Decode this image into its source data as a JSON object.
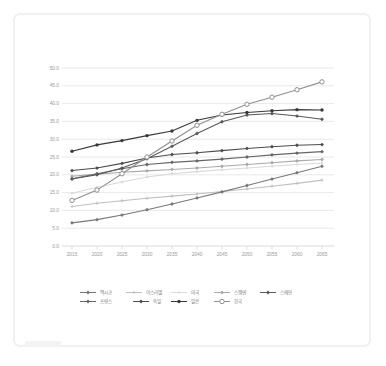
{
  "page": {
    "background": "#ffffff"
  },
  "card": {
    "border_color": "#f1f1f1"
  },
  "chart_data": {
    "type": "line",
    "title": "",
    "xlabel": "",
    "ylabel": "",
    "x_years": [
      2015,
      2020,
      2025,
      2030,
      2035,
      2040,
      2045,
      2050,
      2055,
      2060,
      2065
    ],
    "x_tick_labels": [
      "2015",
      "2020",
      "2025",
      "2030",
      "2035",
      "2040",
      "2045",
      "2050",
      "2055",
      "2060",
      "2065"
    ],
    "y_tick_labels": [
      "0.0",
      "5.0",
      "10.0",
      "15.0",
      "20.0",
      "25.0",
      "30.0",
      "35.0",
      "40.0",
      "45.0",
      "50.0"
    ],
    "ylim": [
      0,
      50
    ],
    "ytick_step": 5,
    "grid": true,
    "legend_position": "bottom",
    "gridline_color": "#e2e2e2",
    "axis_color": "#d6d6d6",
    "series": [
      {
        "id": "mexico",
        "label": "멕시코",
        "color": "#787878",
        "marker": "diamond",
        "legend_row": 1,
        "legend_x": 80,
        "values": [
          6.5,
          7.4,
          8.7,
          10.2,
          11.8,
          13.5,
          15.2,
          17.0,
          18.8,
          20.6,
          22.4
        ]
      },
      {
        "id": "israel",
        "label": "이스라엘",
        "color": "#bfbfbf",
        "marker": "plus",
        "legend_row": 1,
        "legend_x": 126,
        "values": [
          11.1,
          12.0,
          12.7,
          13.4,
          14.0,
          14.6,
          15.3,
          16.0,
          16.8,
          17.6,
          18.5
        ]
      },
      {
        "id": "usa",
        "label": "미국",
        "color": "#d9d9d9",
        "marker": "plus",
        "legend_row": 1,
        "legend_x": 171,
        "values": [
          14.8,
          16.5,
          18.0,
          19.4,
          20.3,
          20.9,
          21.4,
          21.9,
          22.4,
          22.9,
          23.3
        ]
      },
      {
        "id": "sweden",
        "label": "스웨덴",
        "color": "#a9a9a9",
        "marker": "diamond",
        "legend_row": 1,
        "legend_x": 214,
        "values": [
          19.6,
          20.2,
          20.7,
          21.1,
          21.5,
          21.9,
          22.4,
          22.9,
          23.4,
          23.9,
          24.3
        ]
      },
      {
        "id": "spain",
        "label": "스페인",
        "color": "#595959",
        "marker": "diamond",
        "legend_row": 1,
        "legend_x": 260,
        "values": [
          18.8,
          20.0,
          21.9,
          24.5,
          28.0,
          31.6,
          34.9,
          36.8,
          37.2,
          36.5,
          35.6
        ]
      },
      {
        "id": "france",
        "label": "프랑스",
        "color": "#666666",
        "marker": "diamond",
        "legend_row": 2,
        "legend_x": 80,
        "values": [
          18.9,
          20.3,
          21.7,
          22.9,
          23.5,
          23.9,
          24.4,
          25.0,
          25.6,
          26.1,
          26.5
        ]
      },
      {
        "id": "germany",
        "label": "독일",
        "color": "#4d4d4d",
        "marker": "diamond",
        "legend_row": 2,
        "legend_x": 133,
        "values": [
          21.2,
          21.9,
          23.2,
          24.7,
          25.7,
          26.2,
          26.8,
          27.4,
          27.9,
          28.3,
          28.5
        ]
      },
      {
        "id": "japan",
        "label": "일본",
        "color": "#383838",
        "marker": "dot",
        "legend_row": 2,
        "legend_x": 171,
        "values": [
          26.6,
          28.4,
          29.6,
          31.0,
          32.3,
          35.3,
          36.8,
          37.5,
          38.0,
          38.3,
          38.2
        ]
      },
      {
        "id": "korea",
        "label": "한국",
        "color": "#8f8f8f",
        "marker": "open-circle",
        "legend_row": 2,
        "legend_x": 214,
        "values": [
          12.8,
          15.7,
          20.3,
          25.0,
          29.5,
          33.9,
          37.0,
          39.8,
          41.8,
          43.9,
          46.1
        ]
      }
    ],
    "draw_order": [
      "usa",
      "sweden",
      "israel",
      "mexico",
      "france",
      "germany",
      "spain",
      "japan",
      "korea"
    ]
  }
}
